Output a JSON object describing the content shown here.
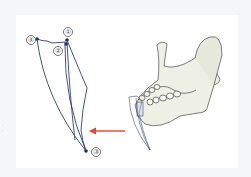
{
  "figure": {
    "labels": [
      {
        "id": "1",
        "text": "①"
      },
      {
        "id": "2",
        "text": "②"
      },
      {
        "id": "3",
        "text": "③"
      },
      {
        "id": "4",
        "text": "④"
      }
    ],
    "colors": {
      "outline": "#2e3f7a",
      "point": "#1f2f6e",
      "arrow": "#e0452f",
      "bone_fill": "#eef0e6",
      "bone_stroke": "#4a4a4a",
      "background": "#f4f6fa",
      "panel": "#ffffff"
    }
  }
}
